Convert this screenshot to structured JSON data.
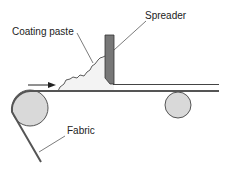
{
  "diagram": {
    "labels": {
      "coating_paste": "Coating paste",
      "spreader": "Spreader",
      "fabric": "Fabric"
    },
    "colors": {
      "spreader_fill": "#777777",
      "roller_fill": "#d9d9d9",
      "paste_fill": "#f2f2f2",
      "line": "#333333"
    }
  }
}
